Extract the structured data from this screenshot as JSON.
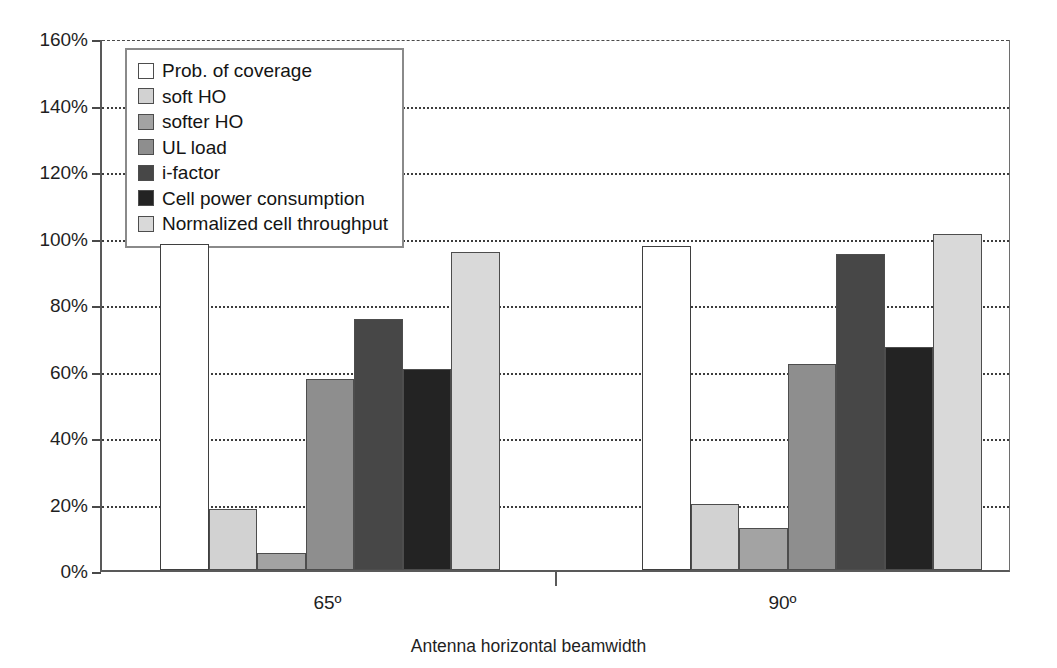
{
  "chart_data": {
    "type": "bar",
    "title": "",
    "subtitle": "",
    "xlabel": "Antenna horizontal beamwidth",
    "ylabel": "",
    "categories": [
      "65º",
      "90º"
    ],
    "ylim": [
      0,
      160
    ],
    "ytick_labels": [
      "0%",
      "20%",
      "40%",
      "60%",
      "80%",
      "100%",
      "120%",
      "140%",
      "160%"
    ],
    "ytick_values": [
      0,
      20,
      40,
      60,
      80,
      100,
      120,
      140,
      160
    ],
    "y_unit": "%",
    "grid": "horizontal-dotted",
    "legend_position": "inside-top-left",
    "series": [
      {
        "name": "Prob. of coverage",
        "values": [
          98,
          97.5
        ],
        "color": "#ffffff"
      },
      {
        "name": "soft HO",
        "values": [
          18.5,
          20
        ],
        "color": "#d2d2d2"
      },
      {
        "name": "softer HO",
        "values": [
          5,
          12.5
        ],
        "color": "#a3a3a3"
      },
      {
        "name": "UL load",
        "values": [
          57.5,
          62
        ],
        "color": "#8e8e8e"
      },
      {
        "name": "i-factor",
        "values": [
          75.5,
          95
        ],
        "color": "#474747"
      },
      {
        "name": "Cell power consumption",
        "values": [
          60.5,
          67
        ],
        "color": "#232323"
      },
      {
        "name": "Normalized cell throughput",
        "values": [
          95.5,
          101
        ],
        "color": "#d9d9d9"
      }
    ]
  },
  "legend": {
    "items": [
      "Prob. of coverage",
      "soft HO",
      "softer HO",
      "UL load",
      "i-factor",
      "Cell power consumption",
      "Normalized cell throughput"
    ]
  },
  "axis": {
    "x_title": "Antenna horizontal beamwidth",
    "x_ticks": [
      "65º",
      "90º"
    ],
    "y_ticks": [
      "160%",
      "140%",
      "120%",
      "100%",
      "80%",
      "60%",
      "40%",
      "20%",
      "0%"
    ]
  }
}
